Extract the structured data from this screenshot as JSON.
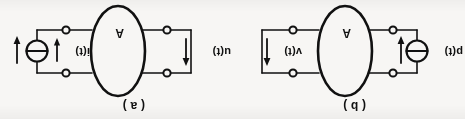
{
  "figure": {
    "orientation": "rotated-180",
    "ink_color": "#111111",
    "paper_color": "#f7f6f4",
    "panels": [
      {
        "id": "a",
        "caption": "( a )",
        "block_letter": "A",
        "left_port": {
          "label": "u(t)",
          "element": "arrow-up",
          "arrow_direction": "up"
        },
        "right_port": {
          "label": "i(t)",
          "element": "current-source",
          "arrow_direction": "down"
        }
      },
      {
        "id": "b",
        "caption": "( b )",
        "block_letter": "A",
        "left_port": {
          "label": "p(t)",
          "element": "current-source",
          "arrow_direction": "down"
        },
        "right_port": {
          "label": "v(t)",
          "element": "arrow-up",
          "arrow_direction": "up"
        }
      }
    ]
  }
}
